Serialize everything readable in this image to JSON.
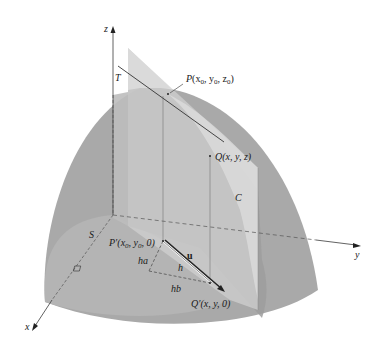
{
  "figure": {
    "type": "3d-surface-directional-derivative",
    "colors": {
      "surface": "#a9a9a9",
      "surface_dark": "#9a9a9a",
      "surface_front": "#b3b3b3",
      "plane": "#d2d2d2",
      "plane_strip": "#c4c4c4",
      "axis": "#3a3a3a",
      "dash": "#555555"
    },
    "axes": {
      "x_label": "x",
      "y_label": "y",
      "z_label": "z"
    },
    "labels": {
      "surface": "S",
      "tangent_line": "T",
      "curve": "C",
      "point_p": "P(x",
      "point_p_full": "P(x0, y0, z0)",
      "point_q_full": "Q(x, y, z)",
      "point_p_prime_full": "P′(x0, y0, 0)",
      "point_q_prime_full": "Q′(x, y, 0)",
      "vector_u": "u",
      "leg_ha": "ha",
      "hyp_h": "h",
      "leg_hb": "hb"
    },
    "text_parts": {
      "p": {
        "name": "P",
        "open": "(x",
        "s1": "0",
        "c1": ", y",
        "s2": "0",
        "c2": ", z",
        "s3": "0",
        "close": ")"
      },
      "q": {
        "name": "Q",
        "rest": "(x, y, z)"
      },
      "pp": {
        "name": "P′",
        "open": "(x",
        "s1": "0",
        "c1": ", y",
        "s2": "0",
        "close": ", 0)"
      },
      "qp": {
        "name": "Q′",
        "rest": "(x, y, 0)"
      }
    }
  }
}
